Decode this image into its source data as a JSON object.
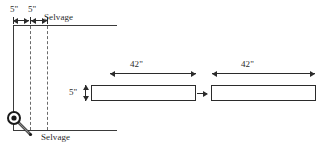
{
  "diagram": {
    "background_color": "#ffffff",
    "line_color": "#2b2b2b",
    "dash_color": "#6a6a6a"
  },
  "fabric_panel": {
    "selvage_top_label": "Selvage",
    "selvage_bottom_label": "Selvage",
    "width_dims": [
      {
        "label": "5\""
      },
      {
        "label": "5\""
      }
    ],
    "cut_line_count": 3,
    "pin_icon": "pin-icon"
  },
  "strips": [
    {
      "length_label": "42\"",
      "height_label": "5\""
    },
    {
      "length_label": "42\""
    }
  ]
}
